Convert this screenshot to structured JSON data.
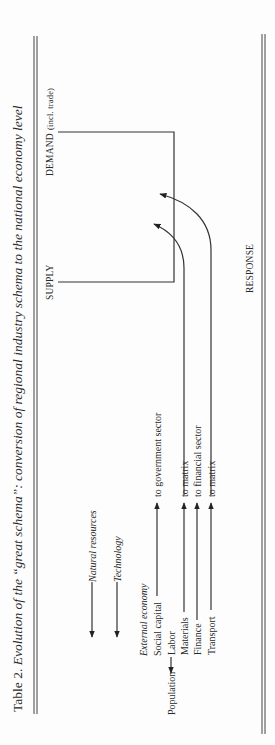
{
  "caption": {
    "prefix": "Table 2. ",
    "title": "Evolution of the “great schema”: conversion of regional industry schema to the national economy level"
  },
  "headers": {
    "supply": "SUPPLY",
    "demand": "DEMAND",
    "demand_note": "(incl. trade)",
    "response": "RESPONSE"
  },
  "inputs": {
    "natural_resources": "Natural resources",
    "technology": "Technology",
    "external_economy": "External economy",
    "social_capital": "Social capital",
    "population": "Population",
    "labor": "Labor",
    "materials": "Materials",
    "finance": "Finance",
    "transport": "Transport"
  },
  "targets": {
    "social_capital": "to government sector",
    "materials": "to matrix",
    "finance": "to financial sector",
    "transport": "to matrix"
  }
}
